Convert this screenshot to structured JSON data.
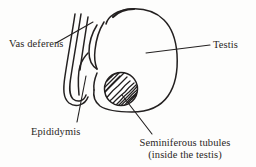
{
  "figure": {
    "type": "anatomical-line-drawing",
    "background_color": "#fdfdfc",
    "stroke_color": "#232020",
    "text_color": "#2a2724"
  },
  "labels": {
    "vas_deferens": "Vas deferens",
    "testis": "Testis",
    "epididymis": "Epididymis",
    "seminiferous_line1": "Seminiferous tubules",
    "seminiferous_line2": "(inside the testis)"
  },
  "structures": [
    {
      "name": "vas-deferens",
      "description": "Pair of long parallel ducts running vertically on the left, joined by a narrow U-turn loop at the lower end"
    },
    {
      "name": "epididymis",
      "description": "Coiled duct curving from the top of the testis down along its left border and looping back"
    },
    {
      "name": "testis",
      "description": "Large rounded ovoid body occupying the right two-thirds of the figure with a notch at the top"
    },
    {
      "name": "seminiferous-tubules",
      "description": "Hatched circle inside the lower testis filled with wavy diagonal lines representing coiled tubules"
    }
  ],
  "leader_lines": [
    {
      "name": "vas-deferens-leader",
      "from_label": "vas_deferens",
      "to_structure": "vas-deferens"
    },
    {
      "name": "testis-leader",
      "from_label": "testis",
      "to_structure": "testis"
    },
    {
      "name": "epididymis-leader",
      "from_label": "epididymis",
      "to_structure": "epididymis"
    },
    {
      "name": "seminiferous-leader",
      "from_label": "seminiferous_line1",
      "to_structure": "seminiferous-tubules"
    }
  ]
}
